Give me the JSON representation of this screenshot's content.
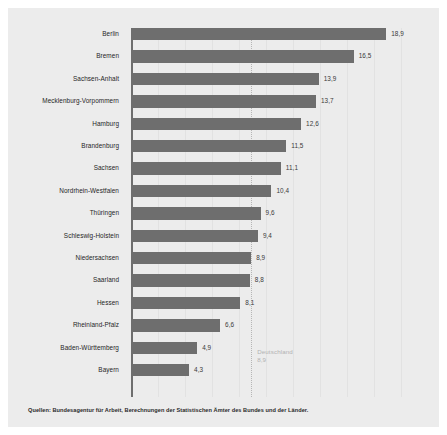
{
  "chart_data": {
    "type": "bar",
    "orientation": "horizontal",
    "title": "",
    "xlabel": "",
    "ylabel": "",
    "grid": true,
    "legend": "none",
    "xlim": [
      0,
      20
    ],
    "categories": [
      "Berlin",
      "Bremen",
      "Sachsen-Anhalt",
      "Mecklenburg-Vorpommern",
      "Hamburg",
      "Brandenburg",
      "Sachsen",
      "Nordrhein-Westfalen",
      "Thüringen",
      "Schleswig-Holstein",
      "Niedersachsen",
      "Saarland",
      "Hessen",
      "Rheinland-Pfalz",
      "Baden-Württemberg",
      "Bayern"
    ],
    "values": [
      18.9,
      16.5,
      13.9,
      13.7,
      12.6,
      11.5,
      11.1,
      10.4,
      9.6,
      9.4,
      8.9,
      8.8,
      8.1,
      6.6,
      4.9,
      4.3
    ],
    "value_labels": [
      "18,9",
      "16,5",
      "13,9",
      "13,7",
      "12,6",
      "11,5",
      "11,1",
      "10,4",
      "9,6",
      "9,4",
      "8,9",
      "8,8",
      "8,1",
      "6,6",
      "4,9",
      "4,3"
    ],
    "reference_line": {
      "label": "Deutschland",
      "value": 8.9,
      "value_label": "8,9"
    },
    "colors": {
      "bar": "#6e6e6e",
      "panel_background": "#ececec",
      "figure_background": "#ffffff",
      "axis": "#6e6e6e",
      "gridline": "#e2e2e2",
      "reference_line": "#b6b6b6",
      "reference_text": "#b2b2b2",
      "category_text": "#1f1f1f",
      "value_text": "#3a3a3a",
      "source_text": "#2a2a2a"
    }
  },
  "source": {
    "text": "Quellen: Bundesagentur für Arbeit, Berechnungen der Statistischen Ämter des Bundes und der Länder."
  }
}
